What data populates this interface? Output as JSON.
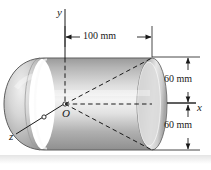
{
  "figure": {
    "background_color": "#ffffff",
    "line_color": "#1a1a1a",
    "body_fill_light": "#f2f2f2",
    "body_fill_mid": "#b9b9b9",
    "body_fill_dark": "#8c8c8c",
    "axes": {
      "y_label": "y",
      "x_label": "x",
      "z_label": "z",
      "origin_label": "O"
    },
    "dimensions": [
      {
        "id": "length",
        "label": "100 mm",
        "orientation": "horizontal",
        "value": 100,
        "unit": "mm"
      },
      {
        "id": "radius-upper",
        "label": "60 mm",
        "orientation": "vertical",
        "value": 60,
        "unit": "mm"
      },
      {
        "id": "radius-lower",
        "label": "60 mm",
        "orientation": "vertical",
        "value": 60,
        "unit": "mm"
      }
    ]
  }
}
